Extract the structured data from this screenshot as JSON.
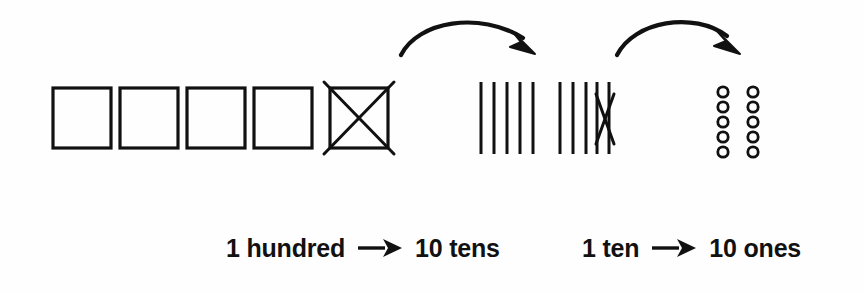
{
  "page": {
    "background_color": "#fefefe",
    "ink_color": "#111111",
    "width": 865,
    "height": 293
  },
  "diagram": {
    "type": "place-value-regrouping",
    "hundreds": {
      "label": "hundreds-flats",
      "count": 5,
      "crossed_out_index": 4,
      "crossed_out_count": 1,
      "shape": "square"
    },
    "tens": {
      "label": "tens-rods",
      "count": 10,
      "groups": [
        5,
        5
      ],
      "crossed_out_index": 9,
      "crossed_out_count": 1,
      "shape": "vertical-line"
    },
    "ones": {
      "label": "ones-units",
      "count": 10,
      "columns": 2,
      "rows": 5,
      "shape": "circle"
    },
    "curved_arrows": [
      {
        "name": "arrow-hundred-to-tens",
        "from": "hundreds",
        "to": "tens"
      },
      {
        "name": "arrow-ten-to-ones",
        "from": "tens",
        "to": "ones"
      }
    ]
  },
  "caption": {
    "statements": [
      {
        "left": "1 hundred",
        "arrow_icon": "right-arrow-icon",
        "right": "10 tens"
      },
      {
        "left": "1 ten",
        "arrow_icon": "right-arrow-icon",
        "right": "10 ones"
      }
    ]
  }
}
